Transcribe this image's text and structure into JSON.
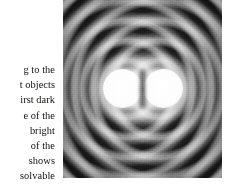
{
  "page": {
    "background_color": "#ffffff",
    "width": 244,
    "height": 190
  },
  "caption": {
    "name": "figure-caption-fragment",
    "note_visible_text_is_clipped_at_left_margin": true,
    "alignment": "right",
    "text_color": "#15120f",
    "lines": [
      "g to the",
      "t objects",
      "irst dark",
      "e of the",
      "bright",
      "of the",
      "shows",
      "solvable"
    ]
  },
  "figure": {
    "name": "airy-diffraction-photograph",
    "type": "grayscale-photograph",
    "frame": {
      "left": 63,
      "top": 0,
      "width": 159,
      "height": 178
    },
    "colors": {
      "film_base": "#494949",
      "ring_bright": "#ebebeb",
      "ring_dark": "#141414",
      "disk_core": "#ffffff"
    },
    "elements": {
      "left_airy_disk": "airy-disk-left",
      "right_airy_disk": "airy-disk-right",
      "ring_system": "concentric-diffraction-rings",
      "central_notch": "inter-disk-dark-notch"
    }
  }
}
